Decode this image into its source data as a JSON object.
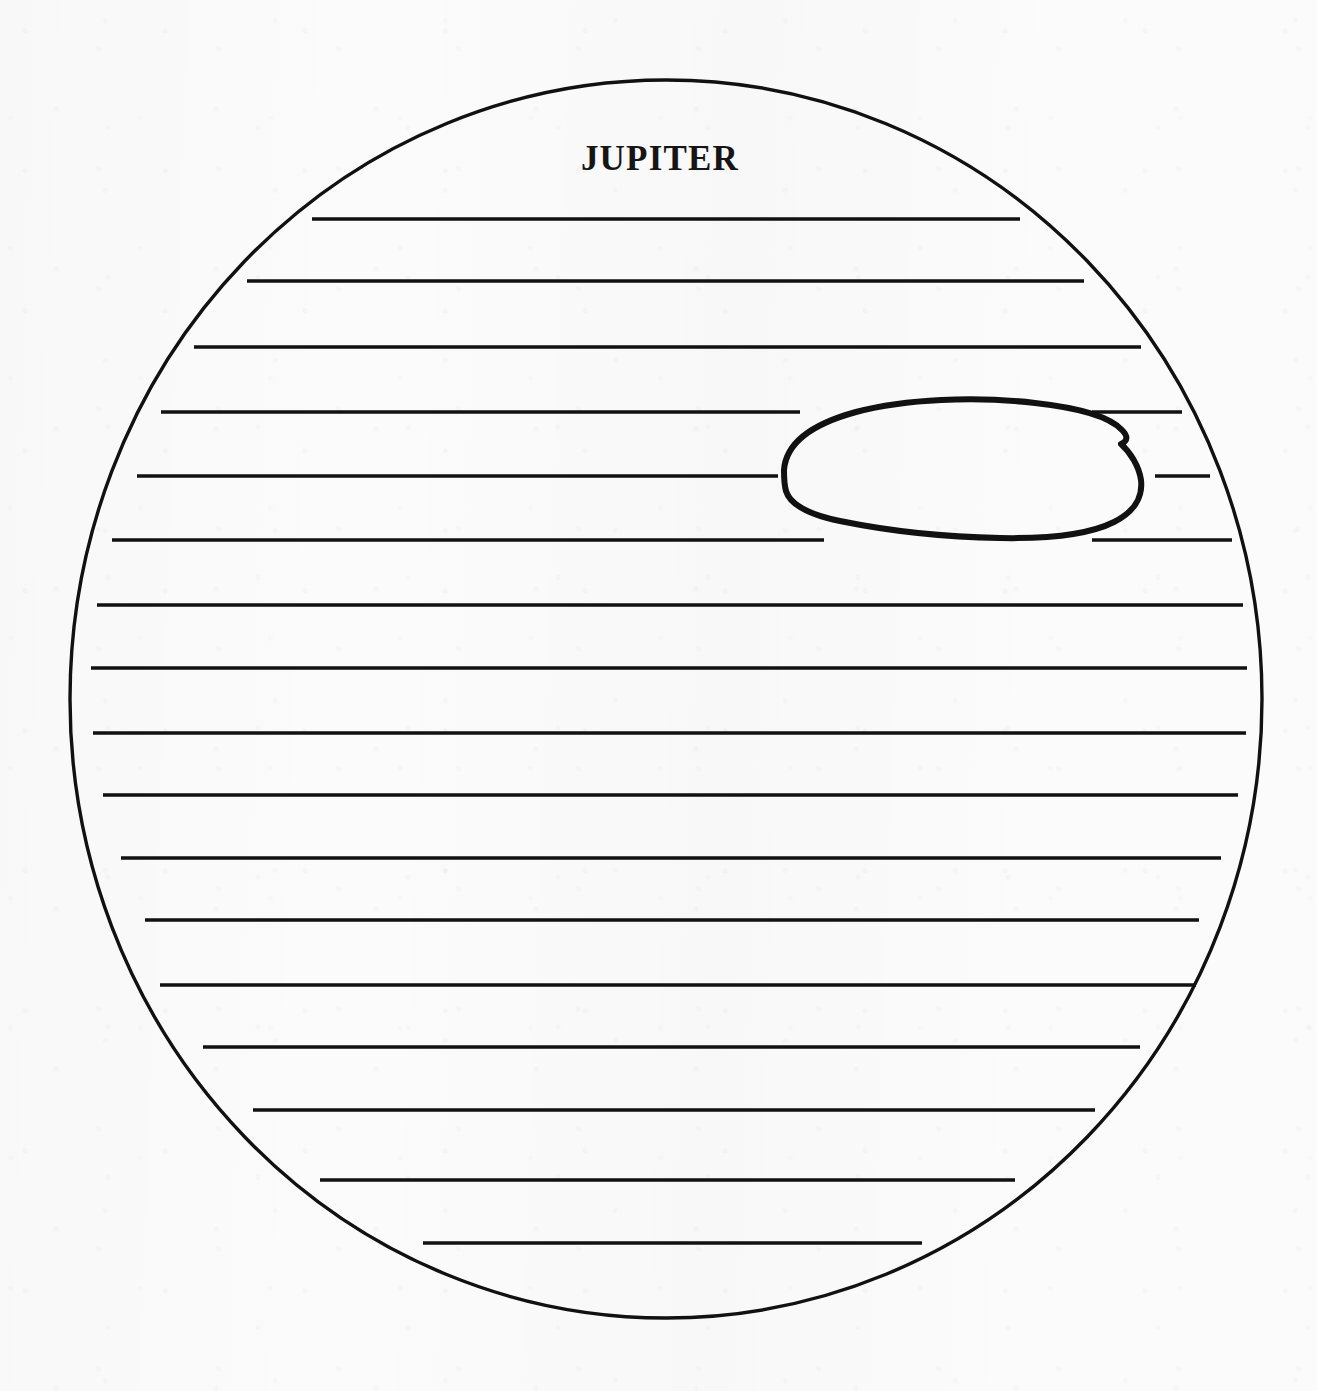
{
  "document": {
    "kind": "science-worksheet-diagram",
    "title": "JUPITER",
    "background_color": "#fbfbfb",
    "ink_color": "#111111",
    "page": {
      "width": 1317,
      "height": 1391
    }
  },
  "title_label": {
    "text": "JUPITER",
    "x": 660,
    "y": 170,
    "font_size": 35,
    "bold": true
  },
  "planet": {
    "name": "Jupiter",
    "shape": "ellipse",
    "center_x": 666,
    "center_y": 699,
    "radius_x": 596,
    "radius_y": 619,
    "stroke_width": 3.4,
    "stroke_color": "#111111",
    "fill": "none"
  },
  "great_red_spot": {
    "name": "Great Red Spot",
    "shape": "hand-drawn-oval-outline",
    "fill": "none",
    "stroke_width": 6,
    "stroke_color": "#111111",
    "bounds": {
      "left": 780,
      "top": 398,
      "right": 1148,
      "bottom": 538
    },
    "path": "M 784 470 C 786 443 812 424 856 412 C 905 399 975 396 1035 403 C 1080 408 1110 417 1122 430 C 1128 436 1128 441 1121 444 C 1130 452 1139 466 1141 480 C 1143 497 1134 512 1114 522 C 1090 534 1050 539 1000 538 C 944 537 884 530 840 521 C 806 514 790 504 786 491 C 784 484 784 477 784 470 Z"
  },
  "bands": [
    {
      "index": 1,
      "y": 219,
      "x1": 312,
      "x2": 1020,
      "width": 3.6,
      "interrupted": false
    },
    {
      "index": 2,
      "y": 281,
      "x1": 247,
      "x2": 1084,
      "width": 3.6,
      "interrupted": false
    },
    {
      "index": 3,
      "y": 347,
      "x1": 194,
      "x2": 1141,
      "width": 3.6,
      "interrupted": false
    },
    {
      "index": 4,
      "y": 412,
      "x1": 161,
      "x2": 1182,
      "width": 3.6,
      "interrupted": true,
      "gap_x1": 800,
      "gap_x2": 1092
    },
    {
      "index": 5,
      "y": 476,
      "x1": 137,
      "x2": 1210,
      "width": 3.6,
      "interrupted": true,
      "gap_x1": 778,
      "gap_x2": 1155
    },
    {
      "index": 6,
      "y": 540,
      "x1": 112,
      "x2": 1232,
      "width": 3.6,
      "interrupted": true,
      "gap_x1": 824,
      "gap_x2": 1092
    },
    {
      "index": 7,
      "y": 605,
      "x1": 97,
      "x2": 1243,
      "width": 3.6,
      "interrupted": false
    },
    {
      "index": 8,
      "y": 668,
      "x1": 91,
      "x2": 1247,
      "width": 3.6,
      "interrupted": false
    },
    {
      "index": 9,
      "y": 733,
      "x1": 93,
      "x2": 1246,
      "width": 3.6,
      "interrupted": false
    },
    {
      "index": 10,
      "y": 795,
      "x1": 103,
      "x2": 1238,
      "width": 3.6,
      "interrupted": false
    },
    {
      "index": 11,
      "y": 858,
      "x1": 121,
      "x2": 1221,
      "width": 3.6,
      "interrupted": false
    },
    {
      "index": 12,
      "y": 920,
      "x1": 145,
      "x2": 1199,
      "width": 3.6,
      "interrupted": false
    },
    {
      "index": 13,
      "y": 985,
      "x1": 160,
      "x2": 1196,
      "width": 3.6,
      "interrupted": false
    },
    {
      "index": 14,
      "y": 1047,
      "x1": 203,
      "x2": 1140,
      "width": 3.6,
      "interrupted": false
    },
    {
      "index": 15,
      "y": 1110,
      "x1": 253,
      "x2": 1095,
      "width": 3.6,
      "interrupted": false
    },
    {
      "index": 16,
      "y": 1180,
      "x1": 320,
      "x2": 1015,
      "width": 3.6,
      "interrupted": false
    },
    {
      "index": 17,
      "y": 1243,
      "x1": 423,
      "x2": 922,
      "width": 3.6,
      "interrupted": false
    }
  ],
  "band_count_label": 17
}
